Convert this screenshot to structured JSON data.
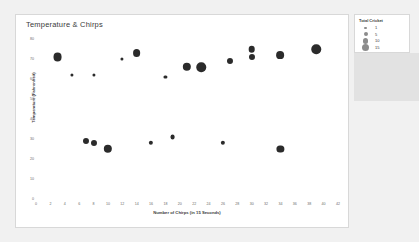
{
  "chart_card": {
    "title": "Temperature & Chirps"
  },
  "legend": {
    "title": "Total Cricket",
    "entries": [
      {
        "label": "1",
        "size": 2.2
      },
      {
        "label": "5",
        "size": 4.0
      },
      {
        "label": "10",
        "size": 5.6
      },
      {
        "label": "15",
        "size": 7.0
      }
    ]
  },
  "chart_data": {
    "type": "scatter",
    "title": "Temperature & Chirps",
    "xlabel": "Number of Chirps (in 15 Seconds)",
    "ylabel": "Temperature (Fahrenheit)",
    "xlim": [
      0,
      42
    ],
    "ylim": [
      0,
      80
    ],
    "xticks": [
      0,
      2,
      4,
      6,
      8,
      10,
      12,
      14,
      16,
      18,
      20,
      22,
      24,
      26,
      28,
      30,
      32,
      34,
      36,
      38,
      40,
      42
    ],
    "yticks": [
      0,
      10,
      20,
      30,
      40,
      50,
      60,
      70,
      80
    ],
    "grid": false,
    "legend_position": "right",
    "size_legend_title": "Total Cricket",
    "size_legend_values": [
      1,
      5,
      10,
      15
    ],
    "point_color": "#2b2b2b",
    "points": [
      {
        "x": 3,
        "y": 71,
        "size": 12
      },
      {
        "x": 5,
        "y": 62,
        "size": 2
      },
      {
        "x": 8,
        "y": 62,
        "size": 2
      },
      {
        "x": 7,
        "y": 29,
        "size": 7
      },
      {
        "x": 8,
        "y": 28,
        "size": 7
      },
      {
        "x": 10,
        "y": 25,
        "size": 11
      },
      {
        "x": 12,
        "y": 70,
        "size": 2
      },
      {
        "x": 14,
        "y": 73,
        "size": 10
      },
      {
        "x": 16,
        "y": 28,
        "size": 4
      },
      {
        "x": 18,
        "y": 61,
        "size": 2
      },
      {
        "x": 19,
        "y": 31,
        "size": 5
      },
      {
        "x": 21,
        "y": 66,
        "size": 11
      },
      {
        "x": 23,
        "y": 66,
        "size": 13
      },
      {
        "x": 26,
        "y": 28,
        "size": 4
      },
      {
        "x": 27,
        "y": 69,
        "size": 7
      },
      {
        "x": 30,
        "y": 75,
        "size": 8
      },
      {
        "x": 30,
        "y": 71,
        "size": 7
      },
      {
        "x": 34,
        "y": 25,
        "size": 9
      },
      {
        "x": 34,
        "y": 72,
        "size": 10
      },
      {
        "x": 39,
        "y": 75,
        "size": 13
      }
    ]
  }
}
